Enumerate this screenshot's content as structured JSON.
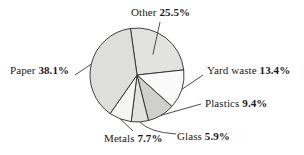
{
  "chart_data": {
    "type": "pie",
    "title": "",
    "subtitle": "",
    "xlabel": "",
    "ylabel": "",
    "legend_position": "none",
    "grid": false,
    "value_unit": "percent",
    "total": 100.0,
    "start_angle_deg": -8,
    "direction": "clockwise",
    "categories": [
      "Other",
      "Yard waste",
      "Plastics",
      "Glass",
      "Metals",
      "Paper"
    ],
    "values": [
      25.5,
      13.4,
      9.4,
      5.9,
      7.7,
      38.1
    ],
    "slices": [
      {
        "label": "Other",
        "value": 25.5,
        "value_text": "25.5%",
        "color": "#e2e2e0",
        "label_position": "top",
        "leader": "diagonal"
      },
      {
        "label": "Yard waste",
        "value": 13.4,
        "value_text": "13.4%",
        "color": "#fafafa",
        "label_position": "right",
        "leader": "horizontal"
      },
      {
        "label": "Plastics",
        "value": 9.4,
        "value_text": "9.4%",
        "color": "#cfcfcd",
        "label_position": "right",
        "leader": "horizontal"
      },
      {
        "label": "Glass",
        "value": 5.9,
        "value_text": "5.9%",
        "color": "#e2e2e0",
        "label_position": "bottom-right",
        "leader": "curved"
      },
      {
        "label": "Metals",
        "value": 7.7,
        "value_text": "7.7%",
        "color": "#f5f5f4",
        "label_position": "bottom",
        "leader": "vertical"
      },
      {
        "label": "Paper",
        "value": 38.1,
        "value_text": "38.1%",
        "color": "#dededc",
        "label_position": "left",
        "leader": "horizontal"
      }
    ],
    "geometry": {
      "center_x": 137,
      "center_y": 75,
      "radius": 47
    },
    "style": {
      "outline_color": "#2b2b2b",
      "leader_color": "#3a3a3a",
      "background": "#ffffff",
      "text_color": "#1a1a1a"
    }
  }
}
